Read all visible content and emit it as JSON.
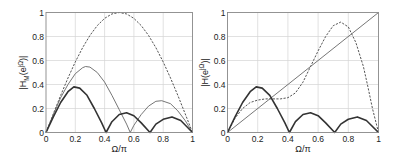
{
  "chart_data": [
    {
      "type": "line",
      "title": "",
      "xlabel": "Ω/π",
      "ylabel": "|H_M(e^{jΩ})|",
      "xlim": [
        0,
        1
      ],
      "ylim": [
        0,
        1
      ],
      "xticks": [
        "0",
        "0.2",
        "0.4",
        "0.6",
        "0.8",
        "1"
      ],
      "yticks": [
        "0",
        "0.2",
        "0.4",
        "0.6",
        "0.8",
        "1"
      ],
      "grid": true,
      "series": [
        {
          "name": "dashed",
          "style": "dashed",
          "x": [
            0,
            0.05,
            0.1,
            0.15,
            0.2,
            0.25,
            0.3,
            0.35,
            0.4,
            0.45,
            0.5,
            0.55,
            0.6,
            0.65,
            0.7,
            0.75,
            0.8,
            0.85,
            0.9,
            0.95,
            1
          ],
          "values": [
            0,
            0.156,
            0.309,
            0.454,
            0.588,
            0.707,
            0.809,
            0.891,
            0.951,
            0.988,
            1,
            0.988,
            0.951,
            0.891,
            0.809,
            0.707,
            0.588,
            0.454,
            0.309,
            0.156,
            0
          ]
        },
        {
          "name": "thin solid",
          "style": "thin",
          "x": [
            0,
            0.05,
            0.1,
            0.15,
            0.2,
            0.25,
            0.27,
            0.3,
            0.35,
            0.4,
            0.45,
            0.5,
            0.55,
            0.575,
            0.6,
            0.65,
            0.7,
            0.75,
            0.79,
            0.85,
            0.9,
            0.95,
            1
          ],
          "values": [
            0,
            0.15,
            0.29,
            0.4,
            0.49,
            0.54,
            0.55,
            0.545,
            0.5,
            0.42,
            0.31,
            0.19,
            0.07,
            0,
            0.06,
            0.15,
            0.22,
            0.26,
            0.265,
            0.24,
            0.18,
            0.1,
            0
          ]
        },
        {
          "name": "thick solid",
          "style": "thick",
          "x": [
            0,
            0.05,
            0.1,
            0.15,
            0.19,
            0.23,
            0.28,
            0.33,
            0.38,
            0.41,
            0.45,
            0.5,
            0.55,
            0.6,
            0.65,
            0.71,
            0.75,
            0.8,
            0.86,
            0.92,
            0.96,
            1
          ],
          "values": [
            0,
            0.13,
            0.25,
            0.34,
            0.38,
            0.37,
            0.31,
            0.2,
            0.08,
            0,
            0.09,
            0.15,
            0.165,
            0.14,
            0.08,
            0,
            0.07,
            0.11,
            0.13,
            0.1,
            0.05,
            0
          ]
        }
      ]
    },
    {
      "type": "line",
      "title": "",
      "xlabel": "Ω/π",
      "ylabel": "|H(e^{jΩ})|",
      "xlim": [
        0,
        1
      ],
      "ylim": [
        0,
        1
      ],
      "xticks": [
        "0",
        "0.2",
        "0.4",
        "0.6",
        "0.8",
        "1"
      ],
      "yticks": [
        "0",
        "0.2",
        "0.4",
        "0.6",
        "0.8",
        "1"
      ],
      "grid": true,
      "series": [
        {
          "name": "diagonal",
          "style": "thin",
          "x": [
            0,
            1
          ],
          "values": [
            0,
            1
          ]
        },
        {
          "name": "dashed",
          "style": "dashed",
          "x": [
            0,
            0.05,
            0.1,
            0.15,
            0.2,
            0.25,
            0.3,
            0.35,
            0.4,
            0.45,
            0.5,
            0.55,
            0.6,
            0.65,
            0.7,
            0.75,
            0.8,
            0.85,
            0.9,
            0.93,
            0.96,
            1
          ],
          "values": [
            0,
            0.12,
            0.2,
            0.25,
            0.27,
            0.28,
            0.28,
            0.28,
            0.29,
            0.33,
            0.42,
            0.55,
            0.68,
            0.8,
            0.89,
            0.92,
            0.88,
            0.75,
            0.55,
            0.38,
            0.2,
            0
          ]
        },
        {
          "name": "thick solid",
          "style": "thick",
          "x": [
            0,
            0.05,
            0.1,
            0.15,
            0.19,
            0.23,
            0.28,
            0.33,
            0.38,
            0.41,
            0.45,
            0.5,
            0.55,
            0.6,
            0.65,
            0.71,
            0.75,
            0.8,
            0.86,
            0.92,
            0.96,
            1
          ],
          "values": [
            0,
            0.13,
            0.25,
            0.34,
            0.38,
            0.37,
            0.31,
            0.2,
            0.08,
            0,
            0.09,
            0.15,
            0.165,
            0.14,
            0.08,
            0,
            0.07,
            0.11,
            0.13,
            0.1,
            0.05,
            0
          ]
        }
      ]
    }
  ],
  "plots": [
    {
      "ylabel_main": "|H",
      "ylabel_sub": "M",
      "ylabel_rest": "(e",
      "ylabel_sup": "jΩ",
      "ylabel_end": ")|",
      "xlabel": "Ω/π"
    },
    {
      "ylabel_main": "|H",
      "ylabel_sub": "",
      "ylabel_rest": "(e",
      "ylabel_sup": "jΩ",
      "ylabel_end": ")|",
      "xlabel": "Ω/π"
    }
  ]
}
